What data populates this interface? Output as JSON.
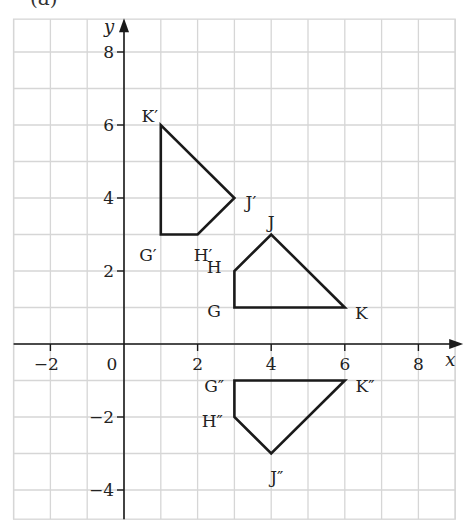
{
  "part_label": "(a)",
  "chart_data": {
    "type": "scatter",
    "subtype": "coordinate-grid-polygons",
    "title": "",
    "xlabel": "x",
    "ylabel": "y",
    "xlim": [
      -3,
      9
    ],
    "ylim": [
      -4.8,
      8.9
    ],
    "grid": true,
    "x_ticks": [
      -2,
      0,
      2,
      4,
      6,
      8
    ],
    "y_ticks": [
      -4,
      -2,
      2,
      4,
      6,
      8
    ],
    "origin_label": "0",
    "polygons": [
      {
        "name": "GHJK",
        "vertices": [
          {
            "label": "G",
            "x": 3,
            "y": 1,
            "lx": -0.55,
            "ly": -0.1
          },
          {
            "label": "H",
            "x": 3,
            "y": 2,
            "lx": -0.55,
            "ly": 0.1
          },
          {
            "label": "J",
            "x": 4,
            "y": 3,
            "lx": 0,
            "ly": 0.35
          },
          {
            "label": "K",
            "x": 6,
            "y": 1,
            "lx": 0.45,
            "ly": -0.15
          }
        ]
      },
      {
        "name": "G'H'J'K'",
        "vertices": [
          {
            "label": "G′",
            "x": 1,
            "y": 3,
            "lx": -0.35,
            "ly": -0.55
          },
          {
            "label": "H′",
            "x": 2,
            "y": 3,
            "lx": 0.15,
            "ly": -0.55
          },
          {
            "label": "J′",
            "x": 3,
            "y": 4,
            "lx": 0.45,
            "ly": -0.1
          },
          {
            "label": "K′",
            "x": 1,
            "y": 6,
            "lx": -0.3,
            "ly": 0.25
          }
        ]
      },
      {
        "name": "G''H''J''K''",
        "vertices": [
          {
            "label": "G″",
            "x": 3,
            "y": -1,
            "lx": -0.55,
            "ly": -0.15
          },
          {
            "label": "H″",
            "x": 3,
            "y": -2,
            "lx": -0.6,
            "ly": -0.1
          },
          {
            "label": "J″",
            "x": 4,
            "y": -3,
            "lx": 0.15,
            "ly": -0.65
          },
          {
            "label": "K″",
            "x": 6,
            "y": -1,
            "lx": 0.55,
            "ly": -0.15
          }
        ]
      }
    ]
  },
  "colors": {
    "grid": "#d6d6d6",
    "axis": "#1a1a1a",
    "polygon": "#1a1a1a",
    "text": "#222222",
    "background": "#ffffff"
  }
}
